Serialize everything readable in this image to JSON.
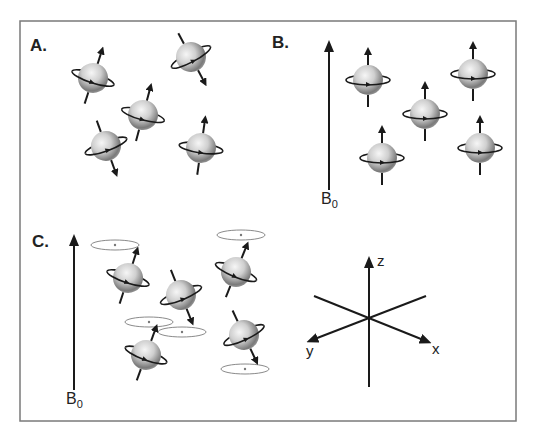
{
  "figure": {
    "frame": {
      "x": 20,
      "y": 21,
      "w": 496,
      "h": 400,
      "stroke": "#7a7a7a"
    },
    "panels": [
      {
        "id": "A",
        "label": "A.",
        "description": "Randomly oriented nuclear spins (no field)",
        "spins": [
          {
            "cx": 93,
            "cy": 78,
            "tilt": 18,
            "dir": "up"
          },
          {
            "cx": 191,
            "cy": 57,
            "tilt": -28,
            "dir": "down"
          },
          {
            "cx": 143,
            "cy": 115,
            "tilt": 15,
            "dir": "up"
          },
          {
            "cx": 106,
            "cy": 146,
            "tilt": -20,
            "dir": "down"
          },
          {
            "cx": 201,
            "cy": 148,
            "tilt": 8,
            "dir": "up"
          }
        ]
      },
      {
        "id": "B",
        "label": "B.",
        "description": "Spins aligned with external field B0",
        "field_label": "B",
        "field_subscript": "0",
        "spins": [
          {
            "cx": 368,
            "cy": 80,
            "tilt": 0,
            "dir": "up"
          },
          {
            "cx": 473,
            "cy": 74,
            "tilt": 0,
            "dir": "up"
          },
          {
            "cx": 425,
            "cy": 114,
            "tilt": 0,
            "dir": "up"
          },
          {
            "cx": 382,
            "cy": 158,
            "tilt": 0,
            "dir": "up"
          },
          {
            "cx": 480,
            "cy": 148,
            "tilt": 0,
            "dir": "up"
          }
        ]
      },
      {
        "id": "C",
        "label": "C.",
        "description": "Spins precessing about B0",
        "field_label": "B",
        "field_subscript": "0",
        "spins": [
          {
            "cx": 128,
            "cy": 278,
            "tilt": 18,
            "dir": "up",
            "cone_cx": 115,
            "cone_cy": 245
          },
          {
            "cx": 181,
            "cy": 295,
            "tilt": -22,
            "dir": "down",
            "cone_cx": 182,
            "cone_cy": 332
          },
          {
            "cx": 236,
            "cy": 272,
            "tilt": 22,
            "dir": "up",
            "cone_cx": 241,
            "cone_cy": 235
          },
          {
            "cx": 146,
            "cy": 355,
            "tilt": 20,
            "dir": "up",
            "cone_cx": 149,
            "cone_cy": 322
          },
          {
            "cx": 244,
            "cy": 335,
            "tilt": -25,
            "dir": "down",
            "cone_cx": 245,
            "cone_cy": 369
          }
        ]
      }
    ],
    "axes": {
      "origin": {
        "x": 369,
        "y": 317
      },
      "labels": {
        "z": "z",
        "x": "x",
        "y": "y"
      }
    },
    "colors": {
      "ink": "#1a1a1a",
      "sphere_light": "#f4f4f4",
      "sphere_mid": "#bdbdbd",
      "sphere_dark": "#6e6e6e",
      "cone": "#888888"
    }
  }
}
